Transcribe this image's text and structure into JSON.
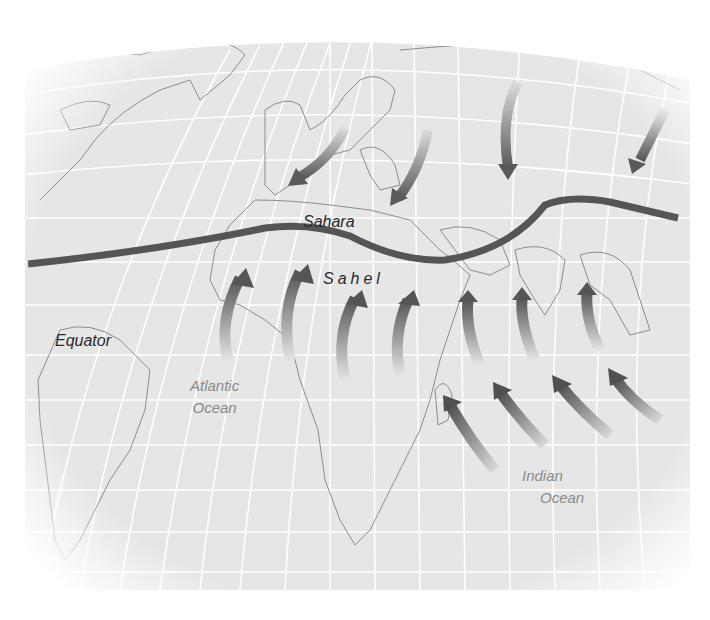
{
  "map": {
    "subject": "Monsoon / trade-wind flow over Africa and Asia relative to the Sahara-Sahel boundary",
    "labels": {
      "sahara": "Sahara",
      "sahel": "Sahel",
      "equator": "Equator",
      "atlantic_line1": "Atlantic",
      "atlantic_line2": "Ocean",
      "indian_line1": "Indian",
      "indian_line2": "Ocean"
    },
    "boundary_line": {
      "name": "Sahara-Sahel boundary (ITCZ)",
      "color": "#555555"
    },
    "arrows": {
      "northern_winds_southward": 5,
      "sahel_winds_northward": 9,
      "indian_ocean_winds_northwest": 4
    },
    "colors": {
      "background": "#ffffff",
      "ocean_land_fill": "#e6e6e6",
      "grid": "#ffffff",
      "coastline": "#8c8c8c",
      "arrow_dark": "#555555",
      "arrow_light": "#e0e0e0"
    }
  }
}
